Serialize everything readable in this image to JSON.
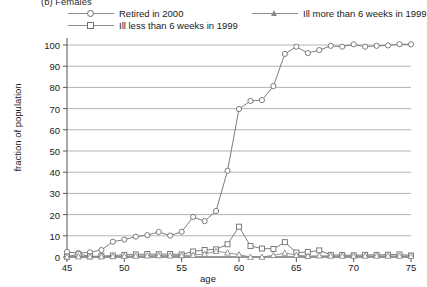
{
  "panel": {
    "title": "(b) Females"
  },
  "legend": {
    "position": "above-plot",
    "entries": [
      {
        "label": "Retired in 2000",
        "marker": "circle-marker-icon",
        "color": "#6e6e6e"
      },
      {
        "label": "Ill less than 6 weeks in 1999",
        "marker": "square-marker-icon",
        "color": "#6e6e6e"
      },
      {
        "label": "Ill more than 6 weeks in 1999",
        "marker": "triangle-marker-icon",
        "color": "#8a8a8a"
      }
    ]
  },
  "chart_data": {
    "type": "line",
    "title": "(b) Females",
    "xlabel": "age",
    "ylabel": "fraction of population",
    "xlim": [
      45,
      75
    ],
    "ylim": [
      0,
      100
    ],
    "xticks": [
      45,
      50,
      55,
      60,
      65,
      70,
      75
    ],
    "yticks": [
      0,
      10,
      20,
      30,
      40,
      50,
      60,
      70,
      80,
      90,
      100
    ],
    "grid": "horizontal",
    "legend_position": "above-plot",
    "x": [
      45,
      46,
      47,
      48,
      49,
      50,
      51,
      52,
      53,
      54,
      55,
      56,
      57,
      58,
      59,
      60,
      61,
      62,
      63,
      64,
      65,
      66,
      67,
      68,
      69,
      70,
      71,
      72,
      73,
      74,
      75
    ],
    "series": [
      {
        "name": "Retired in 2000",
        "marker": "circle",
        "color": "#6e6e6e",
        "values": [
          2.4,
          1.8,
          2.2,
          3.3,
          7.2,
          8.2,
          9.6,
          10.3,
          11.8,
          10.1,
          11.9,
          18.9,
          16.9,
          21.7,
          40.7,
          69.8,
          73.6,
          74.0,
          80.6,
          95.8,
          99.2,
          96.2,
          97.6,
          99.6,
          99.2,
          100.3,
          99.2,
          99.6,
          99.8,
          100.4,
          100.3
        ]
      },
      {
        "name": "Ill less than 6 weeks in 1999",
        "marker": "square",
        "color": "#6e6e6e",
        "values": [
          0.2,
          1.3,
          0.3,
          0.4,
          0.7,
          1.0,
          1.2,
          1.4,
          1.3,
          1.4,
          1.2,
          2.6,
          3.3,
          3.6,
          6.0,
          14.3,
          5.2,
          4.0,
          3.8,
          7.0,
          2.1,
          2.3,
          3.1,
          1.0,
          0.9,
          0.8,
          1.0,
          1.0,
          1.1,
          1.2,
          0.7
        ]
      },
      {
        "name": "Ill more than 6 weeks in 1999",
        "marker": "triangle",
        "color": "#8a8a8a",
        "values": [
          0.1,
          0.2,
          0.2,
          0.2,
          0.3,
          0.4,
          0.5,
          0.6,
          0.7,
          0.6,
          0.7,
          0.9,
          1.4,
          2.7,
          2.0,
          1.1,
          0.0,
          0.0,
          0.8,
          1.9,
          0.9,
          0.4,
          0.6,
          0.5,
          0.5,
          0.5,
          0.5,
          0.5,
          0.5,
          0.5,
          0.4
        ]
      }
    ]
  },
  "colors": {
    "grid": "#aaaaaa",
    "axis": "#555555",
    "background": "#ffffff"
  }
}
